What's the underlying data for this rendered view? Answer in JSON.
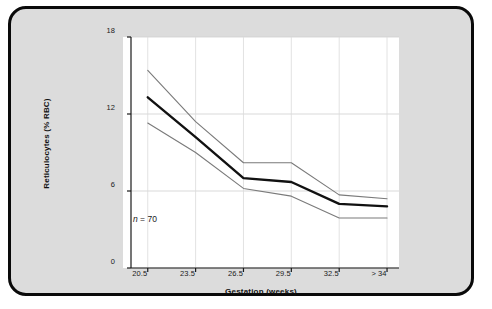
{
  "figure": {
    "background_color": "#dcdcdc",
    "border_color": "#0a0a0a",
    "plot_background_color": "#ffffff"
  },
  "annotation": {
    "n_symbol": "n",
    "n_text": " = 70",
    "full_text": "n = 70"
  },
  "chart_data": {
    "type": "line",
    "title": "",
    "xlabel": "Gestation (weeks)",
    "ylabel": "Reticulocytes (% RBC)",
    "categories": [
      "20.5",
      "23.5",
      "26.5",
      "29.5",
      "32.5",
      "> 34"
    ],
    "x": [
      0,
      1,
      2,
      3,
      4,
      5
    ],
    "yticks": [
      0,
      6,
      12,
      18
    ],
    "ytick_labels": [
      "0",
      "6",
      "12",
      "18"
    ],
    "ylim": [
      0,
      18
    ],
    "xlim": [
      -0.35,
      5.25
    ],
    "grid": true,
    "legend": "none",
    "annotations": [
      "n = 70"
    ],
    "series": [
      {
        "name": "upper-bound",
        "role": "upper reference band",
        "color": "#7a7a7a",
        "width": 1.1,
        "values": [
          15.4,
          11.4,
          8.2,
          8.2,
          5.7,
          5.4
        ]
      },
      {
        "name": "median",
        "role": "mean / median line",
        "color": "#111111",
        "width": 2.4,
        "values": [
          13.3,
          10.2,
          7.0,
          6.7,
          5.0,
          4.8
        ]
      },
      {
        "name": "lower-bound",
        "role": "lower reference band",
        "color": "#7a7a7a",
        "width": 1.1,
        "values": [
          11.3,
          9.0,
          6.2,
          5.6,
          3.9,
          3.9
        ]
      }
    ]
  }
}
